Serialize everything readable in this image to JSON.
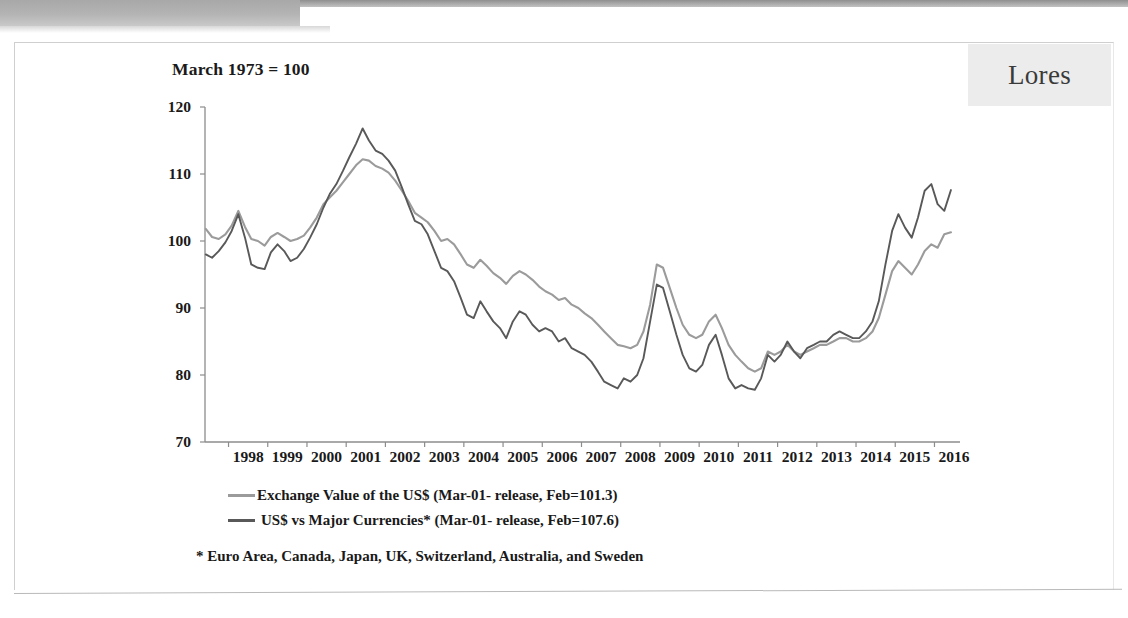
{
  "banner": {
    "name": "top-banner"
  },
  "lores": {
    "label": "Lores"
  },
  "chart_data": {
    "type": "line",
    "title": "March 1973 = 100",
    "xlabel": "",
    "ylabel": "",
    "ylim": [
      70,
      120
    ],
    "yticks": [
      120,
      110,
      100,
      90,
      80,
      70
    ],
    "grid": false,
    "legend_position": "bottom-left",
    "xlim": [
      1997.4,
      2016.6
    ],
    "categories": [
      "1998",
      "1999",
      "2000",
      "2001",
      "2002",
      "2003",
      "2004",
      "2005",
      "2006",
      "2007",
      "2008",
      "2009",
      "2010",
      "2011",
      "2012",
      "2013",
      "2014",
      "2015",
      "2016"
    ],
    "annotations": [
      "* Euro Area, Canada, Japan, UK, Switzerland, Australia, and Sweden"
    ],
    "series": [
      {
        "name": "Exchange Value of the US$ (Mar-01- release, Feb=101.3)",
        "color": "#9b9b9b",
        "latest_value": 101.3,
        "x": [
          1997.42,
          1997.58,
          1997.75,
          1997.92,
          1998.08,
          1998.25,
          1998.42,
          1998.58,
          1998.75,
          1998.92,
          1999.08,
          1999.25,
          1999.42,
          1999.58,
          1999.75,
          1999.92,
          2000.08,
          2000.25,
          2000.42,
          2000.58,
          2000.75,
          2000.92,
          2001.08,
          2001.25,
          2001.42,
          2001.58,
          2001.75,
          2001.92,
          2002.08,
          2002.25,
          2002.42,
          2002.58,
          2002.75,
          2002.92,
          2003.08,
          2003.25,
          2003.42,
          2003.58,
          2003.75,
          2003.92,
          2004.08,
          2004.25,
          2004.42,
          2004.58,
          2004.75,
          2004.92,
          2005.08,
          2005.25,
          2005.42,
          2005.58,
          2005.75,
          2005.92,
          2006.08,
          2006.25,
          2006.42,
          2006.58,
          2006.75,
          2006.92,
          2007.08,
          2007.25,
          2007.42,
          2007.58,
          2007.75,
          2007.92,
          2008.08,
          2008.25,
          2008.42,
          2008.58,
          2008.75,
          2008.92,
          2009.08,
          2009.25,
          2009.42,
          2009.58,
          2009.75,
          2009.92,
          2010.08,
          2010.25,
          2010.42,
          2010.58,
          2010.75,
          2010.92,
          2011.08,
          2011.25,
          2011.42,
          2011.58,
          2011.75,
          2011.92,
          2012.08,
          2012.25,
          2012.42,
          2012.58,
          2012.75,
          2012.92,
          2013.08,
          2013.25,
          2013.42,
          2013.58,
          2013.75,
          2013.92,
          2014.08,
          2014.25,
          2014.42,
          2014.58,
          2014.75,
          2014.92,
          2015.08,
          2015.25,
          2015.42,
          2015.58,
          2015.75,
          2015.92,
          2016.08,
          2016.25,
          2016.42
        ],
        "values": [
          101.8,
          100.6,
          100.3,
          101.0,
          102.3,
          104.5,
          102.1,
          100.3,
          100.0,
          99.3,
          100.6,
          101.2,
          100.6,
          100.0,
          100.3,
          100.8,
          102.0,
          103.5,
          105.5,
          106.5,
          107.5,
          108.8,
          110.0,
          111.3,
          112.2,
          112.0,
          111.2,
          110.8,
          110.2,
          109.0,
          107.5,
          106.0,
          104.2,
          103.5,
          102.8,
          101.5,
          100.0,
          100.3,
          99.5,
          98.0,
          96.5,
          96.0,
          97.2,
          96.3,
          95.2,
          94.5,
          93.6,
          94.8,
          95.5,
          95.0,
          94.2,
          93.2,
          92.5,
          92.0,
          91.2,
          91.5,
          90.5,
          90.0,
          89.2,
          88.5,
          87.5,
          86.5,
          85.5,
          84.5,
          84.3,
          84.0,
          84.5,
          86.5,
          90.5,
          96.5,
          96.0,
          93.0,
          90.0,
          87.5,
          86.0,
          85.5,
          86.0,
          88.0,
          89.0,
          87.0,
          84.5,
          83.0,
          82.0,
          81.0,
          80.5,
          81.0,
          83.5,
          83.0,
          83.5,
          84.5,
          83.5,
          83.0,
          83.5,
          84.0,
          84.5,
          84.5,
          85.0,
          85.5,
          85.5,
          85.0,
          85.0,
          85.5,
          86.5,
          88.5,
          92.0,
          95.5,
          97.0,
          96.0,
          95.0,
          96.5,
          98.5,
          99.5,
          99.0,
          101.0,
          101.3
        ]
      },
      {
        "name": "US$ vs Major Currencies* (Mar-01- release, Feb=107.6)",
        "color": "#595959",
        "latest_value": 107.6,
        "x": [
          1997.42,
          1997.58,
          1997.75,
          1997.92,
          1998.08,
          1998.25,
          1998.42,
          1998.58,
          1998.75,
          1998.92,
          1999.08,
          1999.25,
          1999.42,
          1999.58,
          1999.75,
          1999.92,
          2000.08,
          2000.25,
          2000.42,
          2000.58,
          2000.75,
          2000.92,
          2001.08,
          2001.25,
          2001.42,
          2001.58,
          2001.75,
          2001.92,
          2002.08,
          2002.25,
          2002.42,
          2002.58,
          2002.75,
          2002.92,
          2003.08,
          2003.25,
          2003.42,
          2003.58,
          2003.75,
          2003.92,
          2004.08,
          2004.25,
          2004.42,
          2004.58,
          2004.75,
          2004.92,
          2005.08,
          2005.25,
          2005.42,
          2005.58,
          2005.75,
          2005.92,
          2006.08,
          2006.25,
          2006.42,
          2006.58,
          2006.75,
          2006.92,
          2007.08,
          2007.25,
          2007.42,
          2007.58,
          2007.75,
          2007.92,
          2008.08,
          2008.25,
          2008.42,
          2008.58,
          2008.75,
          2008.92,
          2009.08,
          2009.25,
          2009.42,
          2009.58,
          2009.75,
          2009.92,
          2010.08,
          2010.25,
          2010.42,
          2010.58,
          2010.75,
          2010.92,
          2011.08,
          2011.25,
          2011.42,
          2011.58,
          2011.75,
          2011.92,
          2012.08,
          2012.25,
          2012.42,
          2012.58,
          2012.75,
          2012.92,
          2013.08,
          2013.25,
          2013.42,
          2013.58,
          2013.75,
          2013.92,
          2014.08,
          2014.25,
          2014.42,
          2014.58,
          2014.75,
          2014.92,
          2015.08,
          2015.25,
          2015.42,
          2015.58,
          2015.75,
          2015.92,
          2016.08,
          2016.25,
          2016.42
        ],
        "values": [
          98.0,
          97.5,
          98.5,
          99.8,
          101.5,
          104.0,
          100.5,
          96.5,
          96.0,
          95.8,
          98.3,
          99.5,
          98.5,
          97.0,
          97.5,
          98.8,
          100.5,
          102.5,
          105.0,
          107.0,
          108.5,
          110.5,
          112.5,
          114.5,
          116.8,
          115.0,
          113.5,
          113.0,
          112.0,
          110.5,
          108.0,
          105.5,
          103.0,
          102.5,
          101.0,
          98.5,
          96.0,
          95.5,
          94.0,
          91.5,
          89.0,
          88.5,
          91.0,
          89.5,
          88.0,
          87.0,
          85.5,
          88.0,
          89.5,
          89.0,
          87.5,
          86.5,
          87.0,
          86.5,
          85.0,
          85.5,
          84.0,
          83.5,
          83.0,
          82.0,
          80.5,
          79.0,
          78.5,
          78.0,
          79.5,
          79.0,
          80.0,
          82.5,
          88.0,
          93.5,
          93.0,
          89.5,
          86.0,
          83.0,
          81.0,
          80.5,
          81.5,
          84.5,
          86.0,
          83.0,
          79.5,
          78.0,
          78.5,
          78.0,
          77.8,
          79.5,
          83.0,
          82.0,
          83.0,
          85.0,
          83.5,
          82.5,
          84.0,
          84.5,
          85.0,
          85.0,
          86.0,
          86.5,
          86.0,
          85.5,
          85.5,
          86.5,
          88.0,
          91.0,
          96.5,
          101.5,
          104.0,
          102.0,
          100.5,
          103.5,
          107.5,
          108.5,
          105.5,
          104.5,
          107.6
        ]
      }
    ]
  },
  "footnote": "* Euro Area, Canada, Japan, UK, Switzerland, Australia, and Sweden"
}
